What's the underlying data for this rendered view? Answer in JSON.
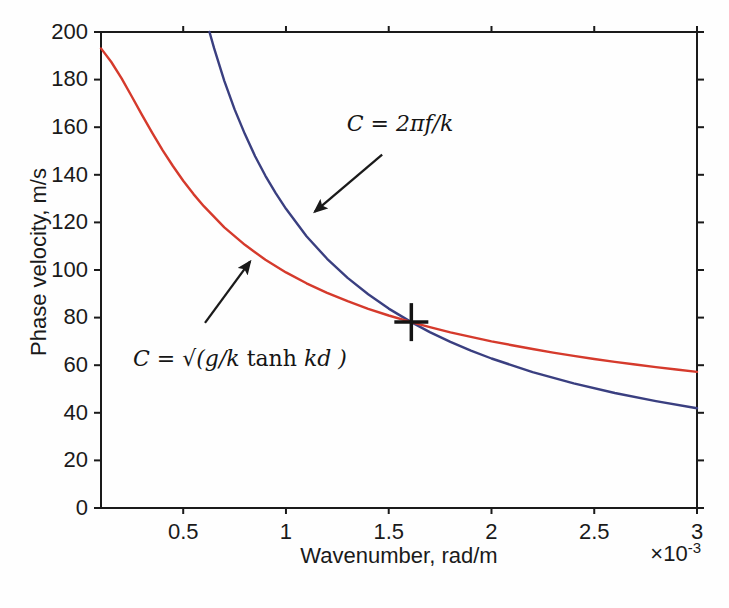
{
  "figure": {
    "background": "#fefefe",
    "axis_color": "#1a1a1a",
    "text_color": "#1a1a1a"
  },
  "chart_data": {
    "type": "line",
    "title": "",
    "xlabel": "Wavenumber, rad/m",
    "ylabel": "Phase velocity, m/s",
    "x_exponent": {
      "base": "×10",
      "power": "-3"
    },
    "x_unit_multiplier": 0.001,
    "xlim": [
      0.1,
      3.0
    ],
    "ylim": [
      0,
      200
    ],
    "grid": false,
    "legend": "none (arrow annotations instead)",
    "x_ticks": {
      "values": [
        0.5,
        1.0,
        1.5,
        2.0,
        2.5,
        3.0
      ],
      "labels": [
        "0.5",
        "1",
        "1.5",
        "2",
        "2.5",
        "3"
      ]
    },
    "y_ticks": {
      "values": [
        0,
        20,
        40,
        60,
        80,
        100,
        120,
        140,
        160,
        180,
        200
      ],
      "labels": [
        "0",
        "20",
        "40",
        "60",
        "80",
        "100",
        "120",
        "140",
        "160",
        "180",
        "200"
      ]
    },
    "series": [
      {
        "id": "blue-curve",
        "name": "C = 2πf/k",
        "color": "#3a3f80",
        "width": 2.4,
        "points": [
          [
            0.628,
            200.0
          ],
          [
            0.65,
            193.3
          ],
          [
            0.7,
            179.5
          ],
          [
            0.75,
            167.5
          ],
          [
            0.8,
            157.1
          ],
          [
            0.85,
            147.8
          ],
          [
            0.9,
            139.6
          ],
          [
            0.95,
            132.3
          ],
          [
            1.0,
            125.7
          ],
          [
            1.1,
            114.2
          ],
          [
            1.2,
            104.7
          ],
          [
            1.3,
            96.7
          ],
          [
            1.4,
            89.8
          ],
          [
            1.5,
            83.8
          ],
          [
            1.61,
            78.1
          ],
          [
            1.7,
            73.9
          ],
          [
            1.8,
            69.8
          ],
          [
            1.9,
            66.1
          ],
          [
            2.0,
            62.8
          ],
          [
            2.2,
            57.1
          ],
          [
            2.4,
            52.4
          ],
          [
            2.6,
            48.3
          ],
          [
            2.8,
            44.9
          ],
          [
            3.0,
            41.9
          ]
        ]
      },
      {
        "id": "red-curve",
        "name": "C = √(g/k tanh kd)",
        "color": "#d53a2c",
        "width": 2.4,
        "points": [
          [
            0.1,
            193.1
          ],
          [
            0.15,
            187.4
          ],
          [
            0.2,
            180.5
          ],
          [
            0.25,
            172.9
          ],
          [
            0.3,
            165.1
          ],
          [
            0.35,
            157.5
          ],
          [
            0.4,
            150.3
          ],
          [
            0.45,
            143.7
          ],
          [
            0.5,
            137.5
          ],
          [
            0.55,
            131.9
          ],
          [
            0.6,
            126.8
          ],
          [
            0.7,
            117.9
          ],
          [
            0.8,
            110.6
          ],
          [
            0.9,
            104.3
          ],
          [
            1.0,
            99.0
          ],
          [
            1.1,
            94.4
          ],
          [
            1.2,
            90.4
          ],
          [
            1.3,
            86.9
          ],
          [
            1.4,
            83.7
          ],
          [
            1.5,
            80.9
          ],
          [
            1.61,
            78.1
          ],
          [
            1.7,
            76.0
          ],
          [
            1.8,
            73.8
          ],
          [
            1.9,
            71.9
          ],
          [
            2.0,
            70.0
          ],
          [
            2.1,
            68.4
          ],
          [
            2.2,
            66.8
          ],
          [
            2.3,
            65.3
          ],
          [
            2.4,
            63.9
          ],
          [
            2.5,
            62.6
          ],
          [
            2.6,
            61.4
          ],
          [
            2.7,
            60.3
          ],
          [
            2.8,
            59.2
          ],
          [
            2.9,
            58.2
          ],
          [
            3.0,
            57.2
          ]
        ]
      }
    ],
    "intersection_marker": {
      "symbol": "plus",
      "x": 1.61,
      "y": 78.1,
      "color": "#141414"
    },
    "annotations": [
      {
        "id": "blue-curve-label",
        "label_x": 1.555,
        "label_y": 161.9,
        "parts": [
          {
            "t": "C = 2πf/k",
            "style": "math"
          }
        ],
        "arrow": {
          "x1": 1.468,
          "y1": 148.5,
          "x2": 1.141,
          "y2": 124.5
        }
      },
      {
        "id": "red-curve-label",
        "label_x": 0.776,
        "label_y": 63.1,
        "parts": [
          {
            "t": "C = √(g/k ",
            "style": "math"
          },
          {
            "t": "tanh",
            "style": "roman"
          },
          {
            "t": " kd )",
            "style": "math"
          }
        ],
        "arrow": {
          "x1": 0.606,
          "y1": 77.8,
          "x2": 0.825,
          "y2": 103.5
        }
      }
    ]
  }
}
